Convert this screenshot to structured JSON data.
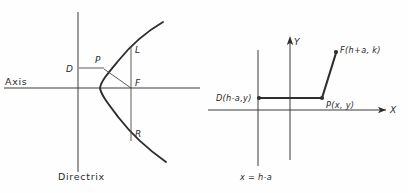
{
  "figure": {
    "background_color": "#fefefe",
    "ink_color": "#2e2e2e",
    "width": 408,
    "height": 193
  },
  "left_diagram": {
    "name": "parabola-geometric-definition",
    "labels": {
      "axis": "Axis",
      "directrix": "Directrix",
      "point_d": "D",
      "point_p": "P",
      "point_f": "F",
      "point_l": "L",
      "point_r": "R"
    },
    "geometry": {
      "axis_y": 88,
      "axis_x_start": 4,
      "axis_x_end": 200,
      "directrix_x": 78,
      "directrix_y_start": 12,
      "directrix_y_end": 172,
      "focus_x": 131,
      "focus_y": 88,
      "vertex_x": 100,
      "point_p_x": 103,
      "point_p_y": 68,
      "point_l_y": 50,
      "point_r_y": 136,
      "latus_top_y": 47,
      "latus_bottom_y": 140
    }
  },
  "right_diagram": {
    "name": "parabola-coordinate-definition",
    "labels": {
      "x_axis": "X",
      "y_axis": "Y",
      "focus": "F(h+a, k)",
      "directrix_point": "D(h-a,y)",
      "moving_point": "P(x, y)",
      "directrix_equation": "x = h-a"
    },
    "geometry": {
      "x_axis_y": 110,
      "x_axis_start": 208,
      "x_axis_end": 392,
      "y_axis_x": 290,
      "y_axis_top": 38,
      "y_axis_bottom": 160,
      "directrix_x": 258,
      "directrix_top": 50,
      "directrix_bottom": 166,
      "point_d_x": 259,
      "point_d_y": 98,
      "point_p_x": 322,
      "point_p_y": 98,
      "point_f_x": 336,
      "point_f_y": 52
    }
  }
}
